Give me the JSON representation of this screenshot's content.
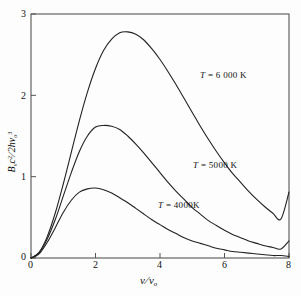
{
  "figure": {
    "background": "#fdfdfd",
    "frame_color": "#555555",
    "curve_color": "#222222"
  },
  "axes": {
    "x": {
      "label_html": "<i>ν</i><span class=\"frac\">/</span><i>ν</i><sub>o</sub>",
      "label_plain": "ν/ν₀",
      "ticks": [
        "0",
        "2",
        "4",
        "6",
        "8"
      ],
      "min": 0,
      "max": 8
    },
    "y": {
      "label_html": "<i>B</i><sub>ν</sub><i>c</i><sup>2</sup><span class=\"frac\">/</span>2<i>h</i><i>ν</i><sub>o</sub><sup>3</sup>",
      "label_plain": "Bν c²/2h ν₀³",
      "ticks": [
        "0",
        "1",
        "2",
        "3"
      ],
      "min": 0,
      "max": 3
    }
  },
  "annotations": [
    {
      "name": "label-6000k",
      "text": "T = 6 000 K",
      "symbol": "T",
      "rest": "= 6 000 K",
      "x_px": 200,
      "y_px": 70
    },
    {
      "name": "label-5000k",
      "text": "T = 5000 K",
      "symbol": "T",
      "rest": "= 5000 K",
      "x_px": 193,
      "y_px": 160
    },
    {
      "name": "label-4000k",
      "text": "T = 4000K",
      "symbol": "T",
      "rest": "= 4000K",
      "x_px": 158,
      "y_px": 200
    }
  ],
  "chart_data": {
    "type": "line",
    "title": "",
    "xlabel": "ν/ν₀",
    "ylabel": "Bν c²/2h ν₀³",
    "xlim": [
      0,
      8
    ],
    "ylim": [
      0,
      3
    ],
    "xticks": [
      0,
      2,
      4,
      6,
      8
    ],
    "yticks": [
      0,
      1,
      2,
      3
    ],
    "grid": false,
    "legend": "inline annotations",
    "x": [
      0,
      0.25,
      0.5,
      0.75,
      1,
      1.25,
      1.5,
      1.75,
      2,
      2.25,
      2.5,
      2.75,
      3,
      3.25,
      3.5,
      3.75,
      4,
      4.25,
      4.5,
      4.75,
      5,
      5.25,
      5.5,
      5.75,
      6,
      6.25,
      6.5,
      6.75,
      7,
      7.25,
      7.5,
      7.75,
      8
    ],
    "series": [
      {
        "name": "T = 6 000 K",
        "temperature_K": 6000,
        "peak_x": 3.63,
        "peak_y": 2.78,
        "values": [
          0,
          0.07,
          0.26,
          0.55,
          0.91,
          1.3,
          1.69,
          2.04,
          2.33,
          2.55,
          2.69,
          2.77,
          2.78,
          2.75,
          2.68,
          2.57,
          2.44,
          2.29,
          2.13,
          1.96,
          1.79,
          1.62,
          1.46,
          1.31,
          1.17,
          1.04,
          0.93,
          0.82,
          0.72,
          0.63,
          0.55,
          0.48,
          0.81
        ]
      },
      {
        "name": "T = 5000 K",
        "temperature_K": 5000,
        "peak_x": 3.05,
        "peak_y": 1.63,
        "values": [
          0,
          0.06,
          0.23,
          0.47,
          0.76,
          1.05,
          1.31,
          1.5,
          1.61,
          1.63,
          1.62,
          1.58,
          1.5,
          1.4,
          1.29,
          1.17,
          1.05,
          0.93,
          0.82,
          0.72,
          0.62,
          0.54,
          0.46,
          0.4,
          0.34,
          0.29,
          0.25,
          0.21,
          0.18,
          0.15,
          0.13,
          0.11,
          0.21
        ]
      },
      {
        "name": "T = 4000K",
        "temperature_K": 4000,
        "peak_x": 2.52,
        "peak_y": 0.86,
        "values": [
          0,
          0.05,
          0.19,
          0.37,
          0.56,
          0.71,
          0.81,
          0.85,
          0.86,
          0.84,
          0.8,
          0.74,
          0.68,
          0.61,
          0.54,
          0.47,
          0.41,
          0.35,
          0.3,
          0.25,
          0.21,
          0.18,
          0.15,
          0.12,
          0.1,
          0.08,
          0.07,
          0.06,
          0.05,
          0.04,
          0.03,
          0.03,
          0.02
        ]
      }
    ]
  }
}
